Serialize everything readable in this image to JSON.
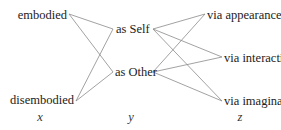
{
  "diagram": {
    "columns": [
      {
        "id": "x",
        "label": "x",
        "nodes": [
          {
            "id": "embodied",
            "label": "embodied"
          },
          {
            "id": "disembodied",
            "label": "disembodied"
          }
        ]
      },
      {
        "id": "y",
        "label": "y",
        "nodes": [
          {
            "id": "self",
            "label": "as Self"
          },
          {
            "id": "other",
            "label": "as Other"
          }
        ]
      },
      {
        "id": "z",
        "label": "z",
        "nodes": [
          {
            "id": "appearance",
            "label": "via appearance"
          },
          {
            "id": "interaction",
            "label": "via interaction"
          },
          {
            "id": "imagination",
            "label": "via imagination"
          }
        ]
      }
    ],
    "edges": [
      {
        "from": "embodied",
        "to": "self"
      },
      {
        "from": "embodied",
        "to": "other"
      },
      {
        "from": "disembodied",
        "to": "self"
      },
      {
        "from": "disembodied",
        "to": "other"
      },
      {
        "from": "self",
        "to": "appearance"
      },
      {
        "from": "self",
        "to": "interaction"
      },
      {
        "from": "self",
        "to": "imagination"
      },
      {
        "from": "other",
        "to": "appearance"
      },
      {
        "from": "other",
        "to": "interaction"
      },
      {
        "from": "other",
        "to": "imagination"
      }
    ],
    "edge_color": "#8a8a8a",
    "text_color": "#222222"
  }
}
